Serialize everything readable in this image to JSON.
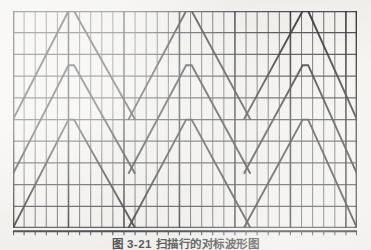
{
  "figure": {
    "caption": "图 3-21  扫描行的对标波形图",
    "background_color": "#f3f2ef",
    "ink_color": "#2f2f33",
    "grid": {
      "minor_vertical_color": "#4a4a4f",
      "major_vertical_color": "#2f2f33",
      "horizontal_color": "#3a3a40",
      "x_min": 0,
      "x_max": 31,
      "y_min": 0,
      "y_max": 10,
      "vertical_line_count": 32,
      "horizontal_line_count": 11,
      "major_vertical_every": 5,
      "grid_on": true
    },
    "axis": {
      "name": "bottom-axis",
      "tick_count": 32,
      "tick_label": "",
      "line_color": "#33333a"
    }
  },
  "chart_data": {
    "type": "line",
    "title": "图 3-21  扫描行的对标波形图",
    "xlabel": "",
    "ylabel": "",
    "xlim": [
      0,
      31
    ],
    "ylim": [
      0,
      10
    ],
    "grid": true,
    "legend": "none",
    "series": [
      {
        "name": "sweep-ramp-top-1",
        "points": [
          [
            0,
            3.33
          ],
          [
            5,
            10
          ],
          [
            5.5,
            10
          ],
          [
            11,
            3.33
          ]
        ]
      },
      {
        "name": "sweep-ramp-top-2",
        "points": [
          [
            10.4,
            3.33
          ],
          [
            15.6,
            10
          ],
          [
            16.1,
            10
          ],
          [
            21.4,
            3.33
          ]
        ]
      },
      {
        "name": "sweep-ramp-top-3",
        "points": [
          [
            20.8,
            3.33
          ],
          [
            26.1,
            10
          ],
          [
            26.6,
            10
          ],
          [
            31,
            3.33
          ]
        ]
      },
      {
        "name": "sweep-ramp-mid-1",
        "points": [
          [
            0,
            0
          ],
          [
            5,
            6.67
          ],
          [
            5.5,
            6.67
          ],
          [
            11,
            0
          ]
        ]
      },
      {
        "name": "sweep-ramp-mid-2",
        "points": [
          [
            10.4,
            0
          ],
          [
            15.6,
            6.67
          ],
          [
            16.1,
            6.67
          ],
          [
            21.4,
            0
          ]
        ]
      },
      {
        "name": "sweep-ramp-mid-3",
        "points": [
          [
            20.8,
            0
          ],
          [
            26.1,
            6.67
          ],
          [
            26.6,
            6.67
          ],
          [
            31,
            0
          ]
        ]
      },
      {
        "name": "sweep-ramp-bottom-1",
        "points": [
          [
            0,
            -3.33
          ],
          [
            5,
            3.33
          ],
          [
            5.5,
            3.33
          ],
          [
            11,
            -3.33
          ]
        ]
      },
      {
        "name": "sweep-ramp-bottom-2",
        "points": [
          [
            10.4,
            -3.33
          ],
          [
            15.6,
            3.33
          ],
          [
            16.1,
            3.33
          ],
          [
            21.4,
            -3.33
          ]
        ]
      },
      {
        "name": "sweep-ramp-bottom-3",
        "points": [
          [
            20.8,
            -3.33
          ],
          [
            26.1,
            3.33
          ],
          [
            26.6,
            3.33
          ],
          [
            31,
            -3.33
          ]
        ]
      }
    ]
  }
}
